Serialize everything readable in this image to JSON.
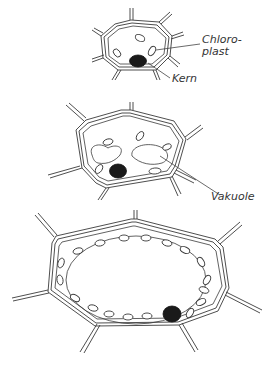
{
  "figure": {
    "stages": [
      {
        "name": "young-cell",
        "labels": [
          "Chloro-\nplast",
          "Kern"
        ]
      },
      {
        "name": "growing-cell",
        "labels": [
          "Vakuole"
        ]
      },
      {
        "name": "mature-cell",
        "labels": []
      }
    ]
  },
  "labels": {
    "chloroplast": "Chloro-\nplast",
    "kern": "Kern",
    "vakuole": "Vakuole"
  },
  "colors": {
    "line": "#3a3a3a",
    "nucleus": "#1a1a1a",
    "background": "#ffffff"
  }
}
